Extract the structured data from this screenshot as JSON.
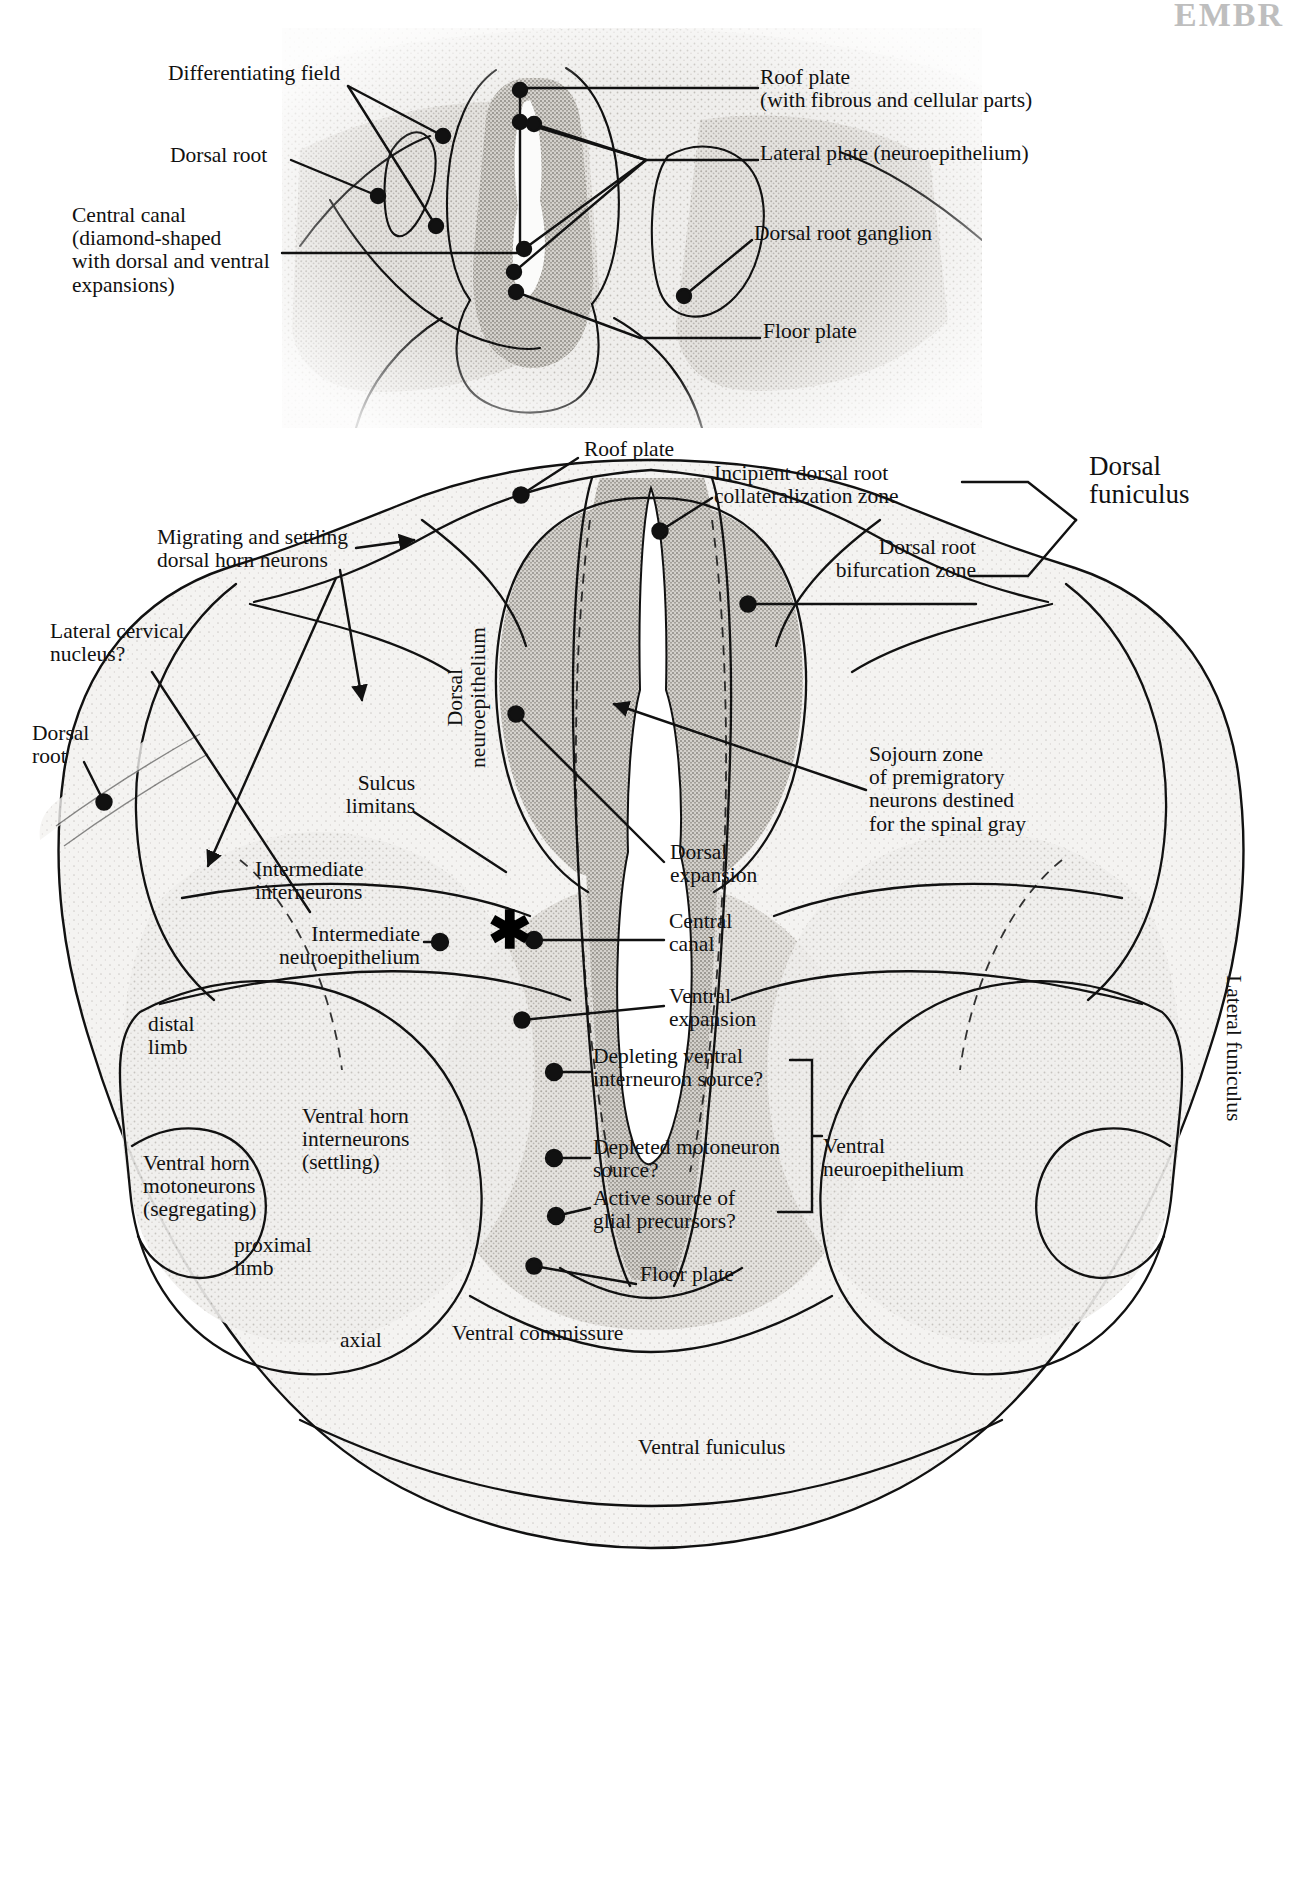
{
  "figure": {
    "type": "anatomical-diagram",
    "top_cut_text": "EMBR"
  },
  "panel_top": {
    "name": "upper-histology-panel",
    "labels": [
      {
        "id": "differentiating-field",
        "text": "Differentiating field",
        "x": 168,
        "y": 72,
        "align": "left"
      },
      {
        "id": "dorsal-root",
        "text": "Dorsal root",
        "x": 170,
        "y": 152,
        "align": "left"
      },
      {
        "id": "central-canal",
        "text": "Central canal\n(diamond-shaped\nwith dorsal and ventral\nexpansions)",
        "x": 72,
        "y": 212,
        "align": "left"
      },
      {
        "id": "roof-plate",
        "text": "Roof plate\n(with fibrous and cellular parts)",
        "x": 760,
        "y": 74,
        "align": "left"
      },
      {
        "id": "lateral-plate",
        "text": "Lateral plate (neuroepithelium)",
        "x": 760,
        "y": 150,
        "align": "left"
      },
      {
        "id": "dorsal-root-ganglion",
        "text": "Dorsal root ganglion",
        "x": 754,
        "y": 229,
        "align": "left"
      },
      {
        "id": "floor-plate",
        "text": "Floor plate",
        "x": 763,
        "y": 327,
        "align": "left"
      }
    ]
  },
  "panel_bottom": {
    "name": "lower-drawing-panel",
    "labels": [
      {
        "id": "roof-plate-2",
        "text": "Roof plate",
        "x": 584,
        "y": 445,
        "align": "left"
      },
      {
        "id": "incipient-dorsal-root-collateralization-zone",
        "text": "Incipient dorsal root\ncollateralization zone",
        "x": 714,
        "y": 470,
        "align": "left"
      },
      {
        "id": "dorsal-funiculus",
        "text": "Dorsal\nfuniculus",
        "x": 1089,
        "y": 462,
        "align": "left",
        "size": "big"
      },
      {
        "id": "dorsal-root-bifurcation-zone",
        "text": "Dorsal root\nbifurcation zone",
        "x": 976,
        "y": 543,
        "align": "right"
      },
      {
        "id": "migrating-settling-dorsal-horn-neurons",
        "text": "Migrating and settling\ndorsal horn neurons",
        "x": 157,
        "y": 534,
        "align": "left"
      },
      {
        "id": "lateral-cervical-nucleus",
        "text": "Lateral cervical\nnucleus?",
        "x": 50,
        "y": 628,
        "align": "left"
      },
      {
        "id": "dorsal-root-2",
        "text": "Dorsal\nroot",
        "x": 32,
        "y": 730,
        "align": "left"
      },
      {
        "id": "sojourn-zone",
        "text": "Sojourn zone\nof premigratory\nneurons destined\nfor the spinal gray",
        "x": 869,
        "y": 751,
        "align": "left"
      },
      {
        "id": "dorsal-neuroepithelium",
        "text": "Dorsal\nneuroepithelium",
        "x": 466,
        "y": 700,
        "align": "left",
        "rotated": true
      },
      {
        "id": "sulcus-limitans",
        "text": "Sulcus\nlimitans",
        "x": 415,
        "y": 780,
        "align": "right"
      },
      {
        "id": "intermediate-interneurons",
        "text": "Intermediate\ninterneurons",
        "x": 255,
        "y": 866,
        "align": "left"
      },
      {
        "id": "dorsal-expansion",
        "text": "Dorsal\nexpansion",
        "x": 670,
        "y": 849,
        "align": "left"
      },
      {
        "id": "intermediate-neuroepithelium",
        "text": "Intermediate\nneuroepithelium",
        "x": 420,
        "y": 931,
        "align": "right"
      },
      {
        "id": "central-canal-2",
        "text": "Central\ncanal",
        "x": 669,
        "y": 918,
        "align": "left"
      },
      {
        "id": "ventral-expansion",
        "text": "Ventral\nexpansion",
        "x": 669,
        "y": 993,
        "align": "left"
      },
      {
        "id": "depleting-ventral-interneuron-source",
        "text": "Depleting ventral\ninterneuron source?",
        "x": 593,
        "y": 1053,
        "align": "left"
      },
      {
        "id": "distal-limb",
        "text": "distal\nlimb",
        "x": 148,
        "y": 1021,
        "align": "left"
      },
      {
        "id": "ventral-horn-interneurons",
        "text": "Ventral horn\ninterneurons\n(settling)",
        "x": 302,
        "y": 1113,
        "align": "left"
      },
      {
        "id": "depleted-motoneuron-source",
        "text": "Depleted motoneuron\nsource?",
        "x": 593,
        "y": 1144,
        "align": "left"
      },
      {
        "id": "ventral-neuroepithelium",
        "text": "Ventral\nneuroepithelium",
        "x": 823,
        "y": 1143,
        "align": "left"
      },
      {
        "id": "active-source-glial-precursors",
        "text": "Active source of\nglial precursors?",
        "x": 593,
        "y": 1195,
        "align": "left"
      },
      {
        "id": "ventral-horn-motoneurons",
        "text": "Ventral horn\nmotoneurons\n(segregating)",
        "x": 143,
        "y": 1160,
        "align": "left"
      },
      {
        "id": "proximal-limb",
        "text": "proximal\nlimb",
        "x": 234,
        "y": 1242,
        "align": "left"
      },
      {
        "id": "floor-plate-2",
        "text": "Floor plate",
        "x": 640,
        "y": 1271,
        "align": "left"
      },
      {
        "id": "axial",
        "text": "axial",
        "x": 340,
        "y": 1337,
        "align": "left"
      },
      {
        "id": "ventral-commissure",
        "text": "Ventral commissure",
        "x": 452,
        "y": 1330,
        "align": "left"
      },
      {
        "id": "lateral-funiculus",
        "text": "Lateral funiculus",
        "x": 1235,
        "y": 985,
        "align": "left",
        "rotated": true
      },
      {
        "id": "ventral-funiculus",
        "text": "Ventral funiculus",
        "x": 638,
        "y": 1444,
        "align": "left"
      }
    ],
    "markers": [
      {
        "id": "asterisk-central-canal",
        "symbol": "✱",
        "x": 488,
        "y": 918
      }
    ]
  },
  "colors": {
    "ink": "#111111",
    "page": "#ffffff",
    "tissue_light": "#d8d5d0",
    "tissue_mid": "#b4b0aa",
    "tissue_dark": "#8e8a84"
  }
}
